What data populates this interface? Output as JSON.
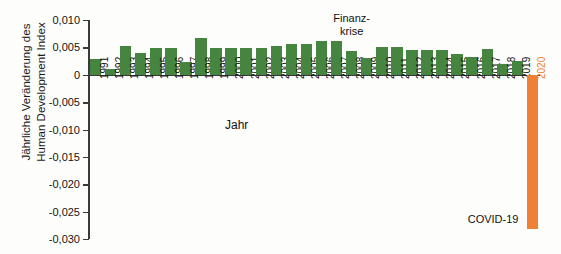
{
  "chart_data": {
    "type": "bar",
    "title": "",
    "xlabel": "Jahr",
    "ylabel": "Jährliche Veränderung des Human Development Index",
    "ylabel_lines": [
      "Jährliche Veränderung des",
      "Human Development Index"
    ],
    "ylim": [
      -0.03,
      0.01
    ],
    "ytick_values": [
      0.01,
      0.005,
      0,
      -0.005,
      -0.01,
      -0.015,
      -0.02,
      -0.025,
      -0.03
    ],
    "ytick_labels": [
      "0,010",
      "0,005",
      "0",
      "-0,005",
      "-0,010",
      "-0,015",
      "-0,020",
      "-0,025",
      "-0,030"
    ],
    "grid": false,
    "legend": "none",
    "categories": [
      "1991",
      "1992",
      "1993",
      "1994",
      "1995",
      "1996",
      "1997",
      "1998",
      "1999",
      "2000",
      "2001",
      "2002",
      "2003",
      "2004",
      "2005",
      "2006",
      "2007",
      "2008",
      "2009",
      "2010",
      "2011",
      "2012",
      "2013",
      "2014",
      "2015",
      "2016",
      "2017",
      "2018",
      "2019",
      "2020"
    ],
    "values": [
      0.0029,
      0.001,
      0.0053,
      0.004,
      0.0048,
      0.0048,
      0.0023,
      0.0067,
      0.0048,
      0.0048,
      0.0048,
      0.0048,
      0.0052,
      0.0057,
      0.0057,
      0.0062,
      0.0062,
      0.0044,
      0.0031,
      0.005,
      0.005,
      0.0046,
      0.0046,
      0.0046,
      0.0038,
      0.0032,
      0.0047,
      0.0019,
      0.0026,
      -0.0281
    ],
    "bar_colors": [
      "#46853f",
      "#46853f",
      "#46853f",
      "#46853f",
      "#46853f",
      "#46853f",
      "#46853f",
      "#46853f",
      "#46853f",
      "#46853f",
      "#46853f",
      "#46853f",
      "#46853f",
      "#46853f",
      "#46853f",
      "#46853f",
      "#46853f",
      "#46853f",
      "#46853f",
      "#46853f",
      "#46853f",
      "#46853f",
      "#46853f",
      "#46853f",
      "#46853f",
      "#46853f",
      "#46853f",
      "#46853f",
      "#46853f",
      "#ef8136"
    ],
    "annotations": [
      {
        "text_lines": [
          "Finanz-",
          "krise"
        ],
        "text": "Finanz- krise",
        "target_category": "2008"
      },
      {
        "text_lines": [
          "COVID-19"
        ],
        "text": "COVID-19",
        "target_category": "2020"
      }
    ],
    "colors": {
      "positive_bar": "#46853f",
      "negative_bar": "#ef8136",
      "axis": "#3a3a3a",
      "text": "#141414",
      "background": "#fdfdfb"
    }
  },
  "annotation_finanzkrise_line1": "Finanz-",
  "annotation_finanzkrise_line2": "krise",
  "annotation_covid": "COVID-19"
}
